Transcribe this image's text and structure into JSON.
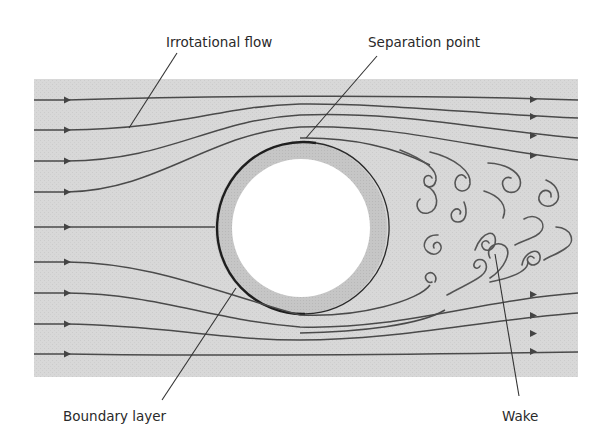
{
  "figure": {
    "labels": {
      "irrotational_flow": "Irrotational flow",
      "separation_point": "Separation point",
      "boundary_layer": "Boundary layer",
      "wake": "Wake"
    },
    "colors": {
      "background_field": "#d6d6d6",
      "boundary_layer_ring": "#c4c4c4",
      "cylinder": "#ffffff",
      "streamline": "#4a4a4a",
      "wall_line": "#1e1e1e"
    },
    "streamline_count_left": 9,
    "streamline_count_right_top": 4,
    "streamline_count_right_bottom": 4
  }
}
